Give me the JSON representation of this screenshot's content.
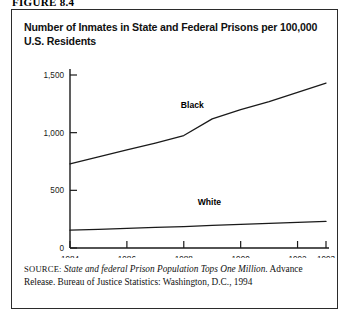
{
  "figure": {
    "number_label": "FIGURE 8.4"
  },
  "chart_title": "Number of Inmates in State and Federal Prisons per 100,000 U.S. Residents",
  "source": {
    "kicker": "SOURCE:",
    "italic_part": "State and federal Prison Population Tops One Million.",
    "rest": "Advance Release. Bureau of Justice Statistics: Washington, D.C., 1994"
  },
  "chart_data": {
    "type": "line",
    "title": "Number of Inmates in State and Federal Prisons per 100,000 U.S. Residents",
    "xlabel": "",
    "ylabel": "",
    "x": [
      1984,
      1985,
      1986,
      1987,
      1988,
      1989,
      1990,
      1991,
      1992,
      1993
    ],
    "xlim": [
      1984,
      1993
    ],
    "ylim": [
      0,
      1500
    ],
    "xticks": [
      1984,
      1986,
      1988,
      1990,
      1992,
      1993
    ],
    "xtick_labels": [
      "1984",
      "1986",
      "1988",
      "1990",
      "1992",
      "1993"
    ],
    "yticks": [
      0,
      500,
      1000,
      1500
    ],
    "ytick_labels": [
      "0",
      "500",
      "1,000",
      "1,500"
    ],
    "grid": false,
    "legend": "inline-annotations",
    "series": [
      {
        "name": "Black",
        "label": "Black",
        "color": "#1a1a1a",
        "values": [
          730,
          790,
          850,
          910,
          975,
          1120,
          1200,
          1270,
          1350,
          1430
        ]
      },
      {
        "name": "White",
        "label": "White",
        "color": "#1a1a1a",
        "values": [
          155,
          162,
          170,
          178,
          186,
          196,
          205,
          214,
          222,
          230
        ]
      }
    ],
    "annotations": [
      {
        "text": "Black",
        "x": 1988.3,
        "y": 1215
      },
      {
        "text": "White",
        "x": 1988.9,
        "y": 375
      }
    ]
  }
}
